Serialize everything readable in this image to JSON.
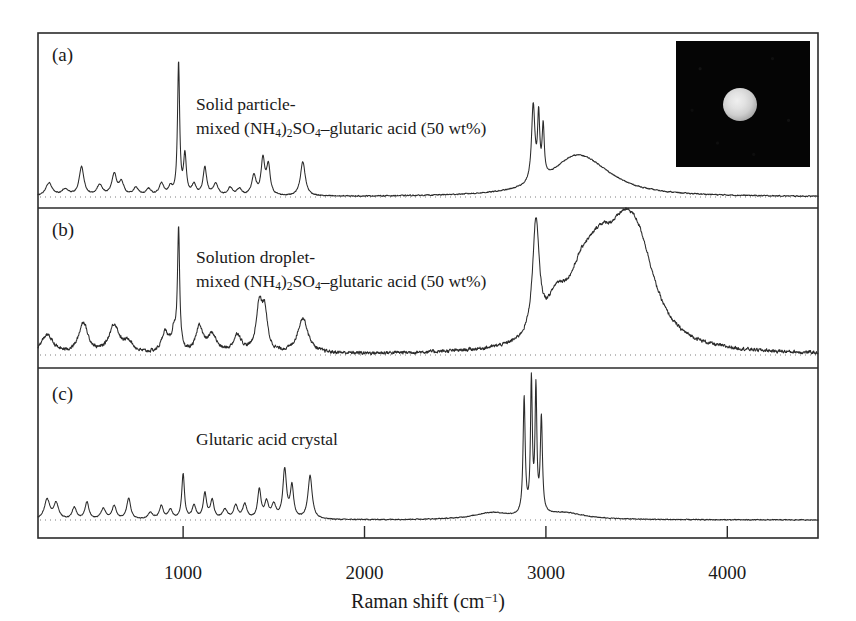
{
  "figure": {
    "axis_title_main": "Raman shift (cm",
    "axis_title_sup": "−1",
    "axis_title_tail": ")",
    "x_ticks": [
      "1000",
      "2000",
      "3000",
      "4000"
    ],
    "panels": [
      {
        "id": "a",
        "panel_label": "(a)",
        "label_line1": "Solid particle-",
        "label_line2_pre": "mixed (NH",
        "label_line2_sub1": "4",
        "label_line2_mid": ")",
        "label_line2_sub2": "2",
        "label_line2_mid2": "SO",
        "label_line2_sub3": "4",
        "label_line2_tail": "–glutaric acid (50 wt%)"
      },
      {
        "id": "b",
        "panel_label": "(b)",
        "label_line1": "Solution droplet-",
        "label_line2_pre": "mixed (NH",
        "label_line2_sub1": "4",
        "label_line2_mid": ")",
        "label_line2_sub2": "2",
        "label_line2_mid2": "SO",
        "label_line2_sub3": "4",
        "label_line2_tail": "–glutaric acid (50 wt%)"
      },
      {
        "id": "c",
        "panel_label": "(c)",
        "label_line1": "Glutaric acid crystal",
        "label_line2_pre": "",
        "label_line2_sub1": "",
        "label_line2_mid": "",
        "label_line2_sub2": "",
        "label_line2_mid2": "",
        "label_line2_sub3": "",
        "label_line2_tail": ""
      }
    ],
    "inset": {
      "name": "optical-micrograph-of-particle",
      "background_color": "#050505",
      "particle_color": "#e2e2e2"
    },
    "colors": {
      "frame": "#2b2b2b",
      "trace": "#2b2b2b",
      "baseline_dotted": "#7d7d7d",
      "background": "#ffffff"
    }
  },
  "chart_data": {
    "type": "line",
    "title": "",
    "xlabel": "Raman shift (cm^-1)",
    "ylabel": "Raman intensity (arb. units)",
    "xlim": [
      200,
      4500
    ],
    "grid": false,
    "legend": "none",
    "x_tick_values": [
      1000,
      2000,
      3000,
      4000
    ],
    "stacked_panels": true,
    "series": [
      {
        "name": "(a) Solid particle-mixed (NH4)2SO4-glutaric acid (50 wt%)",
        "panel": "a",
        "baseline_intensity": 0,
        "peaks": [
          {
            "x": 260,
            "intensity": 0.1,
            "width": 22
          },
          {
            "x": 350,
            "intensity": 0.05,
            "width": 25
          },
          {
            "x": 440,
            "intensity": 0.22,
            "width": 16
          },
          {
            "x": 540,
            "intensity": 0.08,
            "width": 20
          },
          {
            "x": 620,
            "intensity": 0.16,
            "width": 16
          },
          {
            "x": 660,
            "intensity": 0.1,
            "width": 16
          },
          {
            "x": 740,
            "intensity": 0.06,
            "width": 18
          },
          {
            "x": 810,
            "intensity": 0.05,
            "width": 18
          },
          {
            "x": 880,
            "intensity": 0.09,
            "width": 16
          },
          {
            "x": 930,
            "intensity": 0.06,
            "width": 14
          },
          {
            "x": 975,
            "intensity": 1.0,
            "width": 7
          },
          {
            "x": 1010,
            "intensity": 0.3,
            "width": 9
          },
          {
            "x": 1060,
            "intensity": 0.08,
            "width": 14
          },
          {
            "x": 1120,
            "intensity": 0.21,
            "width": 12
          },
          {
            "x": 1180,
            "intensity": 0.09,
            "width": 16
          },
          {
            "x": 1260,
            "intensity": 0.06,
            "width": 16
          },
          {
            "x": 1310,
            "intensity": 0.05,
            "width": 16
          },
          {
            "x": 1390,
            "intensity": 0.15,
            "width": 14
          },
          {
            "x": 1440,
            "intensity": 0.27,
            "width": 12
          },
          {
            "x": 1470,
            "intensity": 0.22,
            "width": 12
          },
          {
            "x": 1660,
            "intensity": 0.26,
            "width": 16
          },
          {
            "x": 2930,
            "intensity": 0.58,
            "width": 11
          },
          {
            "x": 2960,
            "intensity": 0.47,
            "width": 7
          },
          {
            "x": 2985,
            "intensity": 0.38,
            "width": 7
          },
          {
            "x": 3150,
            "intensity": 0.2,
            "width": 160
          },
          {
            "x": 3250,
            "intensity": 0.14,
            "width": 190
          }
        ],
        "noise_level": 0.006
      },
      {
        "name": "(b) Solution droplet-mixed (NH4)2SO4-glutaric acid (50 wt%)",
        "panel": "b",
        "baseline_intensity": 0,
        "peaks": [
          {
            "x": 250,
            "intensity": 0.16,
            "width": 40
          },
          {
            "x": 450,
            "intensity": 0.26,
            "width": 30
          },
          {
            "x": 620,
            "intensity": 0.24,
            "width": 34
          },
          {
            "x": 700,
            "intensity": 0.09,
            "width": 28
          },
          {
            "x": 900,
            "intensity": 0.17,
            "width": 22
          },
          {
            "x": 950,
            "intensity": 0.17,
            "width": 16
          },
          {
            "x": 975,
            "intensity": 1.0,
            "width": 7
          },
          {
            "x": 1090,
            "intensity": 0.22,
            "width": 22
          },
          {
            "x": 1160,
            "intensity": 0.15,
            "width": 30
          },
          {
            "x": 1300,
            "intensity": 0.15,
            "width": 26
          },
          {
            "x": 1420,
            "intensity": 0.39,
            "width": 20
          },
          {
            "x": 1450,
            "intensity": 0.31,
            "width": 18
          },
          {
            "x": 1660,
            "intensity": 0.3,
            "width": 34
          },
          {
            "x": 2945,
            "intensity": 0.95,
            "width": 22
          },
          {
            "x": 3060,
            "intensity": 0.3,
            "width": 70
          },
          {
            "x": 3200,
            "intensity": 0.44,
            "width": 90
          },
          {
            "x": 3300,
            "intensity": 0.46,
            "width": 90
          },
          {
            "x": 3430,
            "intensity": 0.7,
            "width": 120
          },
          {
            "x": 3520,
            "intensity": 0.52,
            "width": 110
          }
        ],
        "noise_level": 0.022
      },
      {
        "name": "(c) Glutaric acid crystal",
        "panel": "c",
        "baseline_intensity": 0,
        "peaks": [
          {
            "x": 250,
            "intensity": 0.15,
            "width": 18
          },
          {
            "x": 300,
            "intensity": 0.12,
            "width": 16
          },
          {
            "x": 400,
            "intensity": 0.09,
            "width": 14
          },
          {
            "x": 470,
            "intensity": 0.13,
            "width": 13
          },
          {
            "x": 560,
            "intensity": 0.08,
            "width": 16
          },
          {
            "x": 620,
            "intensity": 0.1,
            "width": 14
          },
          {
            "x": 700,
            "intensity": 0.16,
            "width": 13
          },
          {
            "x": 820,
            "intensity": 0.05,
            "width": 16
          },
          {
            "x": 880,
            "intensity": 0.1,
            "width": 13
          },
          {
            "x": 930,
            "intensity": 0.07,
            "width": 14
          },
          {
            "x": 1000,
            "intensity": 0.34,
            "width": 9
          },
          {
            "x": 1060,
            "intensity": 0.1,
            "width": 13
          },
          {
            "x": 1120,
            "intensity": 0.19,
            "width": 11
          },
          {
            "x": 1160,
            "intensity": 0.14,
            "width": 12
          },
          {
            "x": 1230,
            "intensity": 0.07,
            "width": 16
          },
          {
            "x": 1290,
            "intensity": 0.1,
            "width": 14
          },
          {
            "x": 1340,
            "intensity": 0.11,
            "width": 14
          },
          {
            "x": 1420,
            "intensity": 0.22,
            "width": 11
          },
          {
            "x": 1460,
            "intensity": 0.12,
            "width": 13
          },
          {
            "x": 1500,
            "intensity": 0.1,
            "width": 14
          },
          {
            "x": 1560,
            "intensity": 0.37,
            "width": 12
          },
          {
            "x": 1600,
            "intensity": 0.24,
            "width": 11
          },
          {
            "x": 1700,
            "intensity": 0.33,
            "width": 14
          },
          {
            "x": 2880,
            "intensity": 0.88,
            "width": 7
          },
          {
            "x": 2920,
            "intensity": 1.0,
            "width": 6
          },
          {
            "x": 2945,
            "intensity": 0.93,
            "width": 6
          },
          {
            "x": 2975,
            "intensity": 0.72,
            "width": 7
          },
          {
            "x": 2700,
            "intensity": 0.05,
            "width": 120
          },
          {
            "x": 3100,
            "intensity": 0.05,
            "width": 140
          }
        ],
        "noise_level": 0.005
      }
    ]
  }
}
